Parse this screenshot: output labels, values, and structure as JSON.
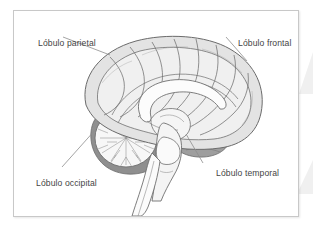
{
  "figure": {
    "type": "anatomical-diagram",
    "language": "es",
    "border_color": "#c8c8c8",
    "background_color": "#ffffff",
    "leader_line_color": "#888888",
    "label_text_color": "#444444",
    "palette": {
      "cortex_fill": "#e3e3e3",
      "cortex_outline": "#6b6b6b",
      "corpus_callosum_fill": "#fbfbfb",
      "cerebellum_fill": "#f4f4f4",
      "cerebellum_rim": "#8c8c8c",
      "temporal_lobe_fill": "#9e9e9e",
      "brainstem_fill": "#f2f2f2",
      "spinal_cord_fill": "#fafafa"
    },
    "labels": [
      {
        "id": "parietal",
        "text": "Lóbulo parietal",
        "structure": "parietal-lobe"
      },
      {
        "id": "frontal",
        "text": "Lóbulo frontal",
        "structure": "frontal-lobe"
      },
      {
        "id": "occipital",
        "text": "Lóbulo occipital",
        "structure": "occipital-lobe"
      },
      {
        "id": "temporal",
        "text": "Lóbulo temporal",
        "structure": "temporal-lobe"
      }
    ]
  }
}
